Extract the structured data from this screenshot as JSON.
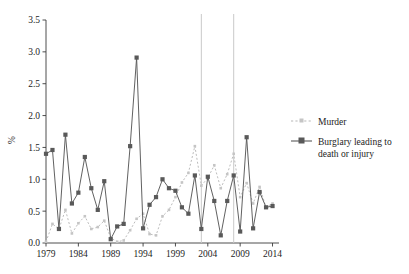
{
  "chart_data": {
    "type": "line",
    "title": "",
    "xlabel": "",
    "ylabel": "%",
    "xlim": [
      1979,
      2015
    ],
    "ylim": [
      0.0,
      3.5
    ],
    "grid": false,
    "legend_position": "right",
    "ytick_labels": [
      "0.0",
      "0.5",
      "1.0",
      "1.5",
      "2.0",
      "2.5",
      "3.0",
      "3.5"
    ],
    "ytick_values": [
      0.0,
      0.5,
      1.0,
      1.5,
      2.0,
      2.5,
      3.0,
      3.5
    ],
    "xtick_labels": [
      "1979",
      "1984",
      "1989",
      "1994",
      "1999",
      "2004",
      "2009",
      "2014"
    ],
    "xtick_values": [
      1979,
      1984,
      1989,
      1994,
      1999,
      2004,
      2009,
      2014
    ],
    "x": [
      1979,
      1980,
      1981,
      1982,
      1983,
      1984,
      1985,
      1986,
      1987,
      1988,
      1989,
      1990,
      1991,
      1992,
      1993,
      1994,
      1995,
      1996,
      1997,
      1998,
      1999,
      2000,
      2001,
      2002,
      2003,
      2004,
      2005,
      2006,
      2007,
      2008,
      2009,
      2010,
      2011,
      2012,
      2013,
      2014
    ],
    "series": [
      {
        "name": "Murder",
        "color": "#b8b8b8",
        "line_style": "dotted",
        "marker": "small-dot",
        "values": [
          0.02,
          0.3,
          0.22,
          0.52,
          0.15,
          0.31,
          0.42,
          0.22,
          0.25,
          0.35,
          0.08,
          0.02,
          0.04,
          0.2,
          0.38,
          0.46,
          0.14,
          0.12,
          0.42,
          0.52,
          0.72,
          0.95,
          1.1,
          1.52,
          0.9,
          1.02,
          1.22,
          0.86,
          1.08,
          1.4,
          0.72,
          0.94,
          0.62,
          0.88,
          0.56,
          0.62
        ]
      },
      {
        "name": "Burglary leading to death or injury",
        "color": "#595959",
        "line_style": "solid",
        "marker": "square",
        "values": [
          1.4,
          1.46,
          0.22,
          1.7,
          0.62,
          0.79,
          1.35,
          0.86,
          0.52,
          0.97,
          0.06,
          0.26,
          0.3,
          1.52,
          2.91,
          0.23,
          0.6,
          0.72,
          1.0,
          0.86,
          0.82,
          0.56,
          0.46,
          1.06,
          0.22,
          1.04,
          0.66,
          0.12,
          0.66,
          1.06,
          0.18,
          1.66,
          0.23,
          0.8,
          0.56,
          0.58
        ]
      }
    ],
    "reference_lines": [
      {
        "x": 2003,
        "orientation": "vertical"
      },
      {
        "x": 2008,
        "orientation": "vertical"
      }
    ],
    "legend_entries": [
      {
        "label": "Murder"
      },
      {
        "label": "Burglary leading to",
        "label2": "death or injury"
      }
    ]
  },
  "legend": {
    "murder_label": "Murder",
    "burglary_label_line1": "Burglary leading to",
    "burglary_label_line2": "death or injury"
  },
  "axes": {
    "y_title": "%"
  },
  "colors": {
    "murder": "#b8b8b8",
    "burglary": "#595959",
    "axis": "#3a3a3a",
    "reference_line": "#c9c9c9",
    "text": "#1d1d1d"
  }
}
